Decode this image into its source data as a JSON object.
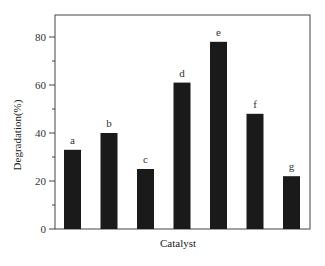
{
  "chart_data": {
    "type": "bar",
    "title": "",
    "xlabel": "Catalyst",
    "ylabel": "Degradation(%)",
    "categories": [
      "a",
      "b",
      "c",
      "d",
      "e",
      "f",
      "g"
    ],
    "values": [
      33,
      40,
      25,
      61,
      78,
      48,
      22
    ],
    "ylim": [
      0,
      88
    ],
    "yticks": [
      0,
      20,
      40,
      60,
      80
    ],
    "yminor_ticks": [
      10,
      30,
      50,
      70
    ],
    "grid": false,
    "legend": null,
    "bar_color": "#1a1a1a",
    "bar_labels_above": true
  }
}
